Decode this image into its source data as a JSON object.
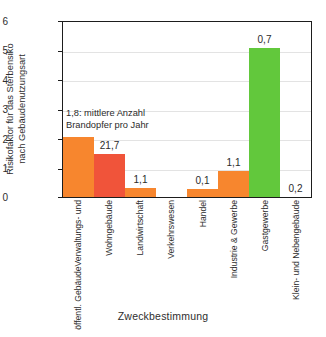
{
  "chart_data": {
    "type": "bar",
    "title": "",
    "xlabel": "Zweckbestimmung",
    "ylabel": "Risikofaktor für das Sterbensiko nach Gebäudenutzungsart",
    "ylabel_lines": [
      "Risikofaktor für das Sterbensiko",
      "nach Gebäudenutzungsart"
    ],
    "categories": [
      "Verwaltungs- und öffentl. Gebäude",
      "Wohngebäude",
      "Landwirtschaft",
      "Verkehrswesen",
      "Handel",
      "Industrie & Gewerbe",
      "Gastgewerbe",
      "Klein- und Nebengebäude"
    ],
    "category_lines": [
      [
        "Verwaltungs- und",
        "öffentl. Gebäude"
      ],
      [
        "Wohngebäude"
      ],
      [
        "Landwirtschaft"
      ],
      [
        "Verkehrswesen"
      ],
      [
        "Handel"
      ],
      [
        "Industrie & Gewerbe"
      ],
      [
        "Gastgewerbe"
      ],
      [
        "Klein- und Nebengebäude"
      ]
    ],
    "values": [
      2.05,
      1.45,
      0.3,
      0,
      0.28,
      0.87,
      5.05,
      0
    ],
    "data_labels": [
      "1,8",
      "21,7",
      "1,1",
      "",
      "0,1",
      "1,1",
      "0,7",
      "0,2"
    ],
    "bar_colors": [
      "#F7862E",
      "#F0543A",
      "#F7862E",
      "#F7862E",
      "#F7862E",
      "#F7862E",
      "#62C83C",
      "#F7862E"
    ],
    "ylim": [
      0,
      6
    ],
    "yticks": [
      "6",
      "5",
      "4",
      "3",
      "2",
      "1",
      "0"
    ],
    "grid": true,
    "legend": "none",
    "annotation_lines": [
      "1,8: mittlere Anzahl",
      "Brandopfer pro Jahr"
    ]
  },
  "axis": {
    "x_title": "Zweckbestimmung"
  }
}
